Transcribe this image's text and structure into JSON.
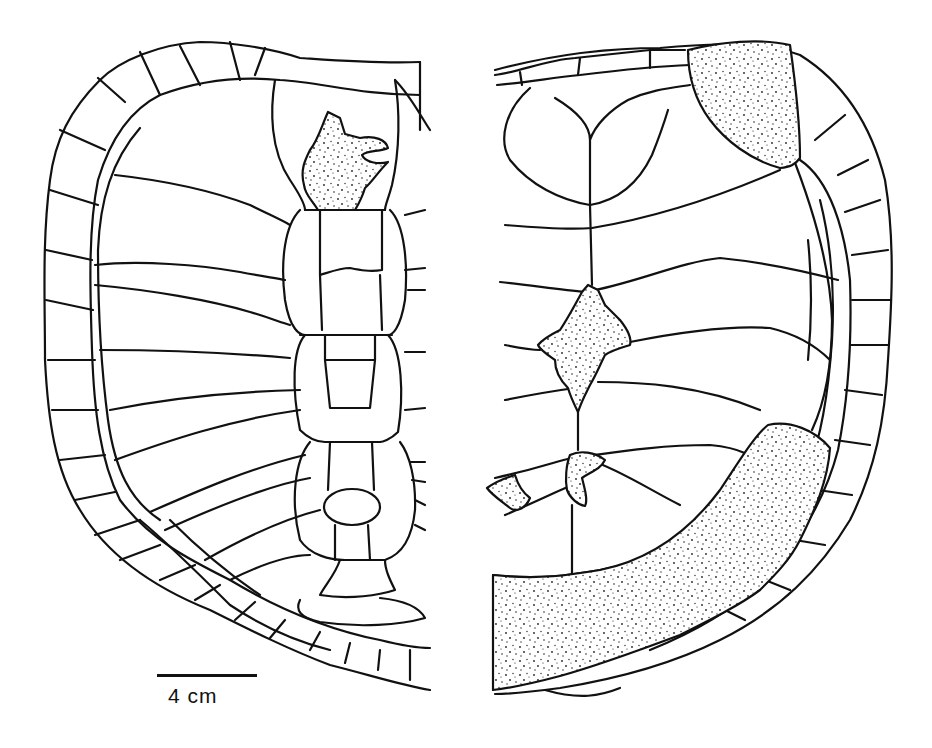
{
  "figure": {
    "panels": [
      {
        "id": "left",
        "view": "carapace (dorsal)",
        "stippled_regions": 1
      },
      {
        "id": "right",
        "view": "carapace (internal/ventral)",
        "stippled_regions": 5
      }
    ],
    "colors": {
      "line": "#111111",
      "background": "#ffffff",
      "stipple": "#222222"
    }
  },
  "scale_bar": {
    "label": "4 cm",
    "length_px": 100
  }
}
